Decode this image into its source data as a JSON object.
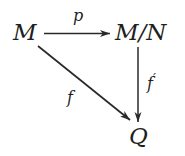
{
  "diagram": {
    "type": "commutative-diagram",
    "background_color": "#ffffff",
    "ink_color": "#1f1f1f",
    "nodes": [
      {
        "id": "M",
        "label": "M",
        "position": "top-left"
      },
      {
        "id": "M/N",
        "label": "M/N",
        "position": "top-right"
      },
      {
        "id": "Q",
        "label": "Q",
        "position": "bottom-right"
      }
    ],
    "edges": [
      {
        "from": "M",
        "to": "M/N",
        "label": "p",
        "direction": "horizontal-right"
      },
      {
        "from": "M/N",
        "to": "Q",
        "label": "f′",
        "direction": "vertical-down"
      },
      {
        "from": "M",
        "to": "Q",
        "label": "f",
        "direction": "diagonal-down-right"
      }
    ],
    "labels": {
      "node_m": "M",
      "node_mn": "M/N",
      "node_q": "Q",
      "edge_p": "p",
      "edge_f_prime_base": "f",
      "edge_f_prime_mark": "′",
      "edge_f": "f"
    }
  }
}
